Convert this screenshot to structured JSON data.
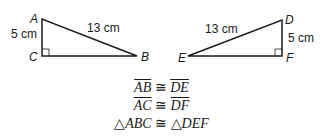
{
  "triangle_left": {
    "vertices": {
      "A": "A",
      "B": "B",
      "C": "C"
    },
    "side_ac": "5 cm",
    "side_ab": "13 cm"
  },
  "triangle_right": {
    "vertices": {
      "D": "D",
      "E": "E",
      "F": "F"
    },
    "side_df": "5 cm",
    "side_de": "13 cm"
  },
  "statements": [
    {
      "left": "AB",
      "symbol": "≅",
      "right": "DE"
    },
    {
      "left": "AC",
      "symbol": "≅",
      "right": "DF"
    },
    {
      "tri": "△",
      "left": "ABC",
      "symbol": "≅",
      "tri2": "△",
      "right": "DEF"
    }
  ],
  "colors": {
    "stroke": "#1a1a1a",
    "background": "#ffffff"
  }
}
